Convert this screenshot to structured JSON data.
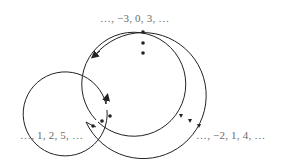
{
  "diagram": {
    "type": "spiral-cycle",
    "labels": {
      "top": "…, −3, 0, 3, …",
      "left": "…, 1, 2, 5, …",
      "right": "…, −2, 1, 4, …"
    },
    "colors": {
      "stroke": "#222222",
      "text": "#6a6a6a",
      "background": "#ffffff"
    },
    "geometry": {
      "center": [
        143,
        95
      ],
      "radii": [
        63,
        52,
        42
      ],
      "dot_angles_deg": [
        90,
        210,
        330
      ]
    }
  }
}
